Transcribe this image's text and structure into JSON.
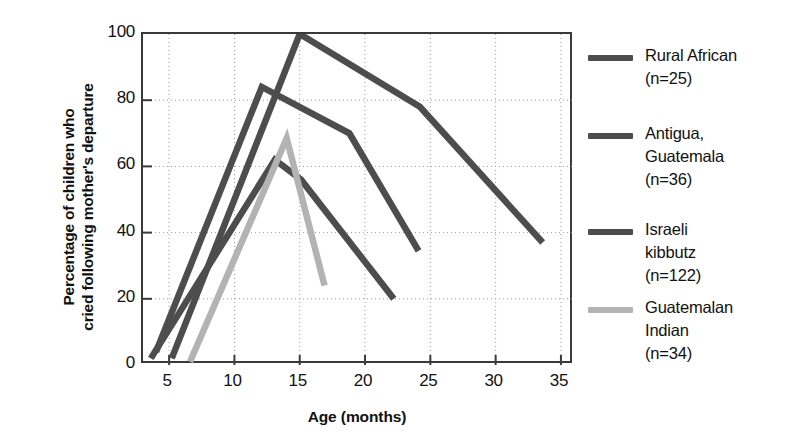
{
  "chart_data": {
    "type": "line",
    "title": "",
    "xlabel": "Age (months)",
    "ylabel_line1": "Percentage of children who",
    "ylabel_line2": "cried following mother's departure",
    "xlim": [
      3,
      36
    ],
    "ylim": [
      0,
      100
    ],
    "xticks": [
      5,
      10,
      15,
      20,
      25,
      30,
      35
    ],
    "yticks": [
      0,
      20,
      40,
      60,
      80,
      100
    ],
    "grid": "dotted",
    "legend_position": "right",
    "series": [
      {
        "name": "Rural African",
        "n_label": "(n=25)",
        "color": "#4d4d4d",
        "x": [
          5.2,
          15.0,
          24.2,
          33.6
        ],
        "y": [
          2,
          100,
          78,
          37
        ]
      },
      {
        "name": "Antigua, Guatemala",
        "name_line1": "Antigua,",
        "name_line2": "Guatemala",
        "n_label": "(n=36)",
        "color": "#4d4d4d",
        "x": [
          4.0,
          12.1,
          18.8,
          24.1
        ],
        "y": [
          4,
          84,
          70,
          34.5
        ]
      },
      {
        "name": "Israeli kibbutz",
        "name_line1": "Israeli",
        "name_line2": "kibbutz",
        "n_label": "(n=122)",
        "color": "#4d4d4d",
        "x": [
          3.6,
          13.1,
          15.1,
          22.2
        ],
        "y": [
          2,
          62,
          56,
          20
        ]
      },
      {
        "name": "Guatemalan Indian",
        "name_line1": "Guatemalan",
        "name_line2": "Indian",
        "n_label": "(n=34)",
        "color": "#b3b3b3",
        "x": [
          6.6,
          14.0,
          16.9
        ],
        "y": [
          1,
          68.5,
          24
        ]
      }
    ]
  },
  "axes": {
    "xlabel": "Age (months)",
    "ylabel_line1": "Percentage of children who",
    "ylabel_line2": "cried following mother's departure",
    "xticks": [
      "5",
      "10",
      "15",
      "20",
      "25",
      "30",
      "35"
    ],
    "yticks": [
      "100",
      "80",
      "60",
      "40",
      "20",
      "0"
    ]
  },
  "legend": {
    "items": [
      {
        "lines": [
          "Rural African",
          "(n=25)"
        ],
        "color": "#4d4d4d"
      },
      {
        "lines": [
          "Antigua,",
          "Guatemala",
          "(n=36)"
        ],
        "color": "#4d4d4d"
      },
      {
        "lines": [
          "Israeli",
          "kibbutz",
          "(n=122)"
        ],
        "color": "#4d4d4d"
      },
      {
        "lines": [
          "Guatemalan",
          "Indian",
          "(n=34)"
        ],
        "color": "#b3b3b3"
      }
    ]
  }
}
